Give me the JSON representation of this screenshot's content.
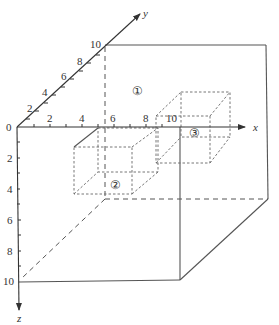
{
  "diagram": {
    "axes": {
      "x": {
        "label": "x",
        "ticks": [
          "2",
          "4",
          "6",
          "8",
          "10"
        ]
      },
      "y": {
        "label": "y",
        "ticks": [
          "2",
          "4",
          "6",
          "8",
          "10"
        ]
      },
      "z": {
        "label": "z",
        "ticks": [
          "2",
          "4",
          "6",
          "8",
          "10"
        ]
      },
      "origin": "0"
    },
    "regions": [
      {
        "id": "1",
        "label": "①"
      },
      {
        "id": "2",
        "label": "②"
      },
      {
        "id": "3",
        "label": "③"
      }
    ],
    "colors": {
      "line": "#555555",
      "text": "#333333",
      "background": "#ffffff"
    }
  }
}
